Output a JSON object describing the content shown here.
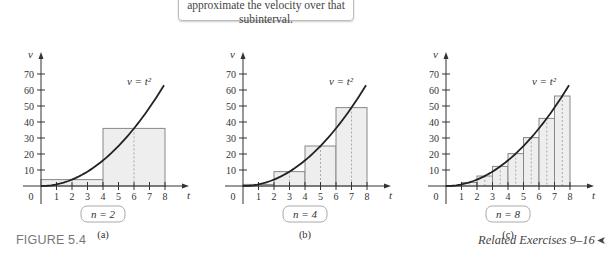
{
  "caption_text": "approximate the velocity over that subinterval.",
  "figure_label": "FIGURE 5.4",
  "related_exercises": "Related Exercises 9–16",
  "related_arrow": "➤",
  "chart_data": [
    {
      "type": "bar",
      "subtitle": "(a)",
      "n_label": "n = 2",
      "curve_label": "v = t²",
      "xlabel": "t",
      "ylabel": "v",
      "xticks": [
        1,
        2,
        3,
        4,
        5,
        6,
        7,
        8
      ],
      "yticks": [
        10,
        20,
        30,
        40,
        50,
        60,
        70
      ],
      "xlim": [
        0,
        8
      ],
      "ylim": [
        0,
        70
      ],
      "intervals": [
        [
          0,
          4
        ],
        [
          4,
          8
        ]
      ],
      "midpoints": [
        2,
        6
      ],
      "values": [
        4,
        36
      ]
    },
    {
      "type": "bar",
      "subtitle": "(b)",
      "n_label": "n = 4",
      "curve_label": "v = t²",
      "xlabel": "t",
      "ylabel": "v",
      "xticks": [
        1,
        2,
        3,
        4,
        5,
        6,
        7,
        8
      ],
      "yticks": [
        10,
        20,
        30,
        40,
        50,
        60,
        70
      ],
      "xlim": [
        0,
        8
      ],
      "ylim": [
        0,
        70
      ],
      "intervals": [
        [
          0,
          2
        ],
        [
          2,
          4
        ],
        [
          4,
          6
        ],
        [
          6,
          8
        ]
      ],
      "midpoints": [
        1,
        3,
        5,
        7
      ],
      "values": [
        1,
        9,
        25,
        49
      ]
    },
    {
      "type": "bar",
      "subtitle": "(c)",
      "n_label": "n = 8",
      "curve_label": "v = t²",
      "xlabel": "t",
      "ylabel": "v",
      "xticks": [
        1,
        2,
        3,
        4,
        5,
        6,
        7,
        8
      ],
      "yticks": [
        10,
        20,
        30,
        40,
        50,
        60,
        70
      ],
      "xlim": [
        0,
        8
      ],
      "ylim": [
        0,
        70
      ],
      "intervals": [
        [
          0,
          1
        ],
        [
          1,
          2
        ],
        [
          2,
          3
        ],
        [
          3,
          4
        ],
        [
          4,
          5
        ],
        [
          5,
          6
        ],
        [
          6,
          7
        ],
        [
          7,
          8
        ]
      ],
      "midpoints": [
        0.5,
        1.5,
        2.5,
        3.5,
        4.5,
        5.5,
        6.5,
        7.5
      ],
      "values": [
        0.25,
        2.25,
        6.25,
        12.25,
        20.25,
        30.25,
        42.25,
        56.25
      ]
    }
  ]
}
